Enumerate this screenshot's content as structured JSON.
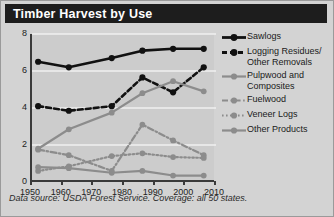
{
  "header": {
    "title": "Timber Harvest by Use"
  },
  "footer": {
    "text": "Data source: USDA Forest Service. Coverage: all 50 states."
  },
  "colors": {
    "header_bg": "#1d1d1d",
    "header_text": "#ffffff",
    "page_bg": "#d3d3d3",
    "plot_bg": "#cccccc",
    "axis": "#3a3a3a",
    "gridline": "#f0f0f0",
    "black_series": "#111111",
    "gray_series": "#8c8c8c"
  },
  "legend": {
    "position": "right",
    "items": [
      {
        "label": "Sawlogs",
        "color": "#111111",
        "style": "solid",
        "marker": "circle"
      },
      {
        "label": "Logging Residues/\nOther Removals",
        "color": "#111111",
        "style": "dashed",
        "marker": "circle"
      },
      {
        "label": "Pulpwood and\nComposites",
        "color": "#8c8c8c",
        "style": "solid",
        "marker": "circle"
      },
      {
        "label": "Fuelwood",
        "color": "#8c8c8c",
        "style": "dashdot",
        "marker": "circle"
      },
      {
        "label": "Veneer Logs",
        "color": "#8c8c8c",
        "style": "dotted",
        "marker": "circle"
      },
      {
        "label": "Other Products",
        "color": "#8c8c8c",
        "style": "solid",
        "marker": "circle"
      }
    ]
  },
  "axes": {
    "y_label": "Billion Cubic Feet per Year",
    "y_ticks": [
      0,
      2,
      4,
      6,
      8
    ],
    "x_ticks": [
      1950,
      1960,
      1970,
      1980,
      1990,
      2000,
      2010
    ]
  },
  "chart_data": {
    "type": "line",
    "title": "Timber Harvest by Use",
    "xlabel": "",
    "ylabel": "Billion Cubic Feet per Year",
    "xlim": [
      1950,
      2010
    ],
    "ylim": [
      0,
      8
    ],
    "x": [
      1952,
      1962,
      1976,
      1986,
      1996,
      2006
    ],
    "grid": true,
    "legend_position": "right",
    "series": [
      {
        "name": "Sawlogs",
        "color": "#111111",
        "style": "solid",
        "values": [
          6.5,
          6.2,
          6.7,
          7.1,
          7.2,
          7.2
        ]
      },
      {
        "name": "Logging Residues/Other Removals",
        "color": "#111111",
        "style": "dashed",
        "values": [
          4.1,
          3.85,
          4.1,
          5.65,
          4.85,
          6.2
        ]
      },
      {
        "name": "Pulpwood and Composites",
        "color": "#8c8c8c",
        "style": "solid",
        "values": [
          1.8,
          2.85,
          3.75,
          4.8,
          5.45,
          4.9
        ]
      },
      {
        "name": "Fuelwood",
        "color": "#8c8c8c",
        "style": "dashdot",
        "values": [
          1.75,
          1.45,
          0.6,
          3.1,
          2.25,
          1.45
        ]
      },
      {
        "name": "Veneer Logs",
        "color": "#8c8c8c",
        "style": "dotted",
        "values": [
          0.6,
          0.85,
          1.4,
          1.55,
          1.35,
          1.3
        ]
      },
      {
        "name": "Other Products",
        "color": "#8c8c8c",
        "style": "solid",
        "values": [
          0.8,
          0.75,
          0.5,
          0.6,
          0.35,
          0.35
        ]
      }
    ]
  }
}
